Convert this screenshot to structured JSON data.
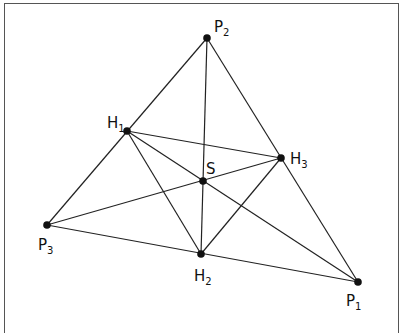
{
  "diagram": {
    "line_color": "#222222",
    "points": [
      {
        "id": "P1",
        "base": "P",
        "sub": "1",
        "x": 358,
        "y": 282,
        "lx": 346,
        "ly": 306
      },
      {
        "id": "P2",
        "base": "P",
        "sub": "2",
        "x": 207,
        "y": 38,
        "lx": 214,
        "ly": 32
      },
      {
        "id": "P3",
        "base": "P",
        "sub": "3",
        "x": 47,
        "y": 225,
        "lx": 38,
        "ly": 250
      },
      {
        "id": "H1",
        "base": "H",
        "sub": "1",
        "x": 127,
        "y": 131,
        "lx": 107,
        "ly": 128
      },
      {
        "id": "H2",
        "base": "H",
        "sub": "2",
        "x": 201,
        "y": 254,
        "lx": 194,
        "ly": 281
      },
      {
        "id": "H3",
        "base": "H",
        "sub": "3",
        "x": 281,
        "y": 158,
        "lx": 290,
        "ly": 164
      },
      {
        "id": "S",
        "base": "S",
        "sub": "",
        "x": 203,
        "y": 181,
        "lx": 206,
        "ly": 174
      }
    ],
    "segments": [
      [
        "P3",
        "P2"
      ],
      [
        "P2",
        "P1"
      ],
      [
        "P3",
        "P1"
      ],
      [
        "H1",
        "H3"
      ],
      [
        "H1",
        "H2"
      ],
      [
        "H2",
        "H3"
      ],
      [
        "P2",
        "H2"
      ],
      [
        "P3",
        "H3"
      ],
      [
        "H1",
        "P1"
      ]
    ]
  }
}
